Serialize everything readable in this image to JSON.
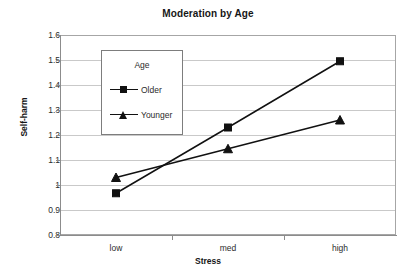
{
  "chart_data": {
    "type": "line",
    "title": "Moderation by Age",
    "xlabel": "Stress",
    "ylabel": "Self-harm",
    "categories": [
      "low",
      "med",
      "high"
    ],
    "series": [
      {
        "name": "Older",
        "marker": "square",
        "values": [
          0.967,
          1.23,
          1.495
        ]
      },
      {
        "name": "Younger",
        "marker": "triangle",
        "values": [
          1.03,
          1.145,
          1.26
        ]
      }
    ],
    "legend": {
      "title": "Age",
      "position": "inside-upper-left"
    },
    "ylim": [
      0.8,
      1.6
    ],
    "ytick_labels": [
      "1.6",
      "1.5",
      "1.4",
      "1.3",
      "1.2",
      "1.1",
      "1",
      "0.9",
      "0.8"
    ],
    "ytick_values": [
      1.6,
      1.5,
      1.4,
      1.3,
      1.2,
      1.1,
      1.0,
      0.9,
      0.8
    ],
    "grid": "horizontal",
    "colors": {
      "series_line": "#111111",
      "gridline": "#c9c9c9",
      "axis": "#8c8c8c",
      "plot_border": "#a6a6a6",
      "background": "#ffffff",
      "text": "#2b2b2b"
    }
  }
}
